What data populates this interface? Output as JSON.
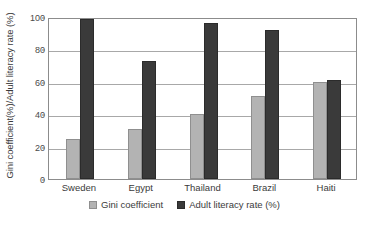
{
  "chart_data": {
    "type": "bar",
    "title": "",
    "xlabel": "",
    "ylabel": "Gini coefficient(%)/Adult literacy rate (%)",
    "ylim": [
      0,
      100
    ],
    "yticks": [
      0,
      20,
      40,
      60,
      80,
      100
    ],
    "grid": true,
    "legend_position": "bottom",
    "categories": [
      "Sweden",
      "Egypt",
      "Thailand",
      "Brazil",
      "Haiti"
    ],
    "series": [
      {
        "name": "Gini coefficient",
        "color": "#b3b3b3",
        "values": [
          25,
          31,
          40,
          51,
          60
        ]
      },
      {
        "name": "Adult literacy rate (%)",
        "color": "#3a3a3a",
        "values": [
          99,
          73,
          96,
          92,
          61
        ]
      }
    ]
  }
}
